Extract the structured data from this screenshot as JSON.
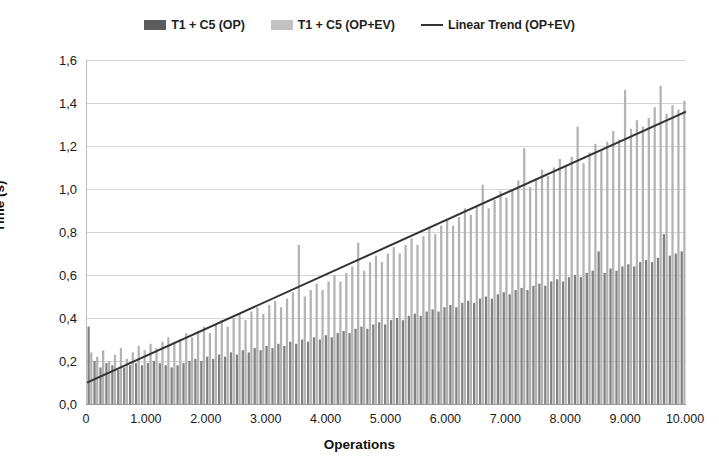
{
  "chart": {
    "type": "bar",
    "background": "#ffffff",
    "legend": {
      "position": "top-center",
      "entries": [
        {
          "label": "T1 + C5 (OP)",
          "swatch": "dark-gray-bar",
          "color": "#5c5c5c"
        },
        {
          "label": "T1 + C5 (OP+EV)",
          "swatch": "light-gray-bar",
          "color": "#c2c2c2"
        },
        {
          "label": "Linear Trend (OP+EV)",
          "swatch": "trend-line",
          "color": "#333333"
        }
      ]
    },
    "axes": {
      "y": {
        "label": "Time (s)",
        "ticks": [
          "0,0",
          "0,2",
          "0,4",
          "0,6",
          "0,8",
          "1,0",
          "1,2",
          "1,4",
          "1,6"
        ],
        "min": 0.0,
        "max": 1.6,
        "step": 0.2,
        "grid": true
      },
      "x": {
        "label": "Operations",
        "ticks": [
          "0",
          "1.000",
          "2.000",
          "3.000",
          "4.000",
          "5.000",
          "6.000",
          "7.000",
          "8.000",
          "9.000",
          "10.000"
        ],
        "min": 0,
        "max": 10000,
        "step": 1000,
        "grid": false
      }
    }
  },
  "chart_data": {
    "type": "bar",
    "title": "",
    "subtitle": "",
    "xlabel": "Operations",
    "ylabel": "Time (s)",
    "xlim": [
      0,
      10000
    ],
    "ylim": [
      0,
      1.6
    ],
    "grid": true,
    "legend_position": "top-center",
    "x": [
      0,
      100,
      200,
      300,
      400,
      500,
      600,
      700,
      800,
      900,
      1000,
      1100,
      1200,
      1300,
      1400,
      1500,
      1600,
      1700,
      1800,
      1900,
      2000,
      2100,
      2200,
      2300,
      2400,
      2500,
      2600,
      2700,
      2800,
      2900,
      3000,
      3100,
      3200,
      3300,
      3400,
      3500,
      3600,
      3700,
      3800,
      3900,
      4000,
      4100,
      4200,
      4300,
      4400,
      4500,
      4600,
      4700,
      4800,
      4900,
      5000,
      5100,
      5200,
      5300,
      5400,
      5500,
      5600,
      5700,
      5800,
      5900,
      6000,
      6100,
      6200,
      6300,
      6400,
      6500,
      6600,
      6700,
      6800,
      6900,
      7000,
      7100,
      7200,
      7300,
      7400,
      7500,
      7600,
      7700,
      7800,
      7900,
      8000,
      8100,
      8200,
      8300,
      8400,
      8500,
      8600,
      8700,
      8800,
      8900,
      9000,
      9100,
      9200,
      9300,
      9400,
      9500,
      9600,
      9700,
      9800,
      9900,
      10000
    ],
    "series": [
      {
        "name": "T1 + C5 (OP)",
        "type": "bar",
        "color": "#808080",
        "values": [
          0.36,
          0.2,
          0.17,
          0.19,
          0.18,
          0.16,
          0.17,
          0.18,
          0.19,
          0.18,
          0.19,
          0.2,
          0.19,
          0.18,
          0.17,
          0.18,
          0.19,
          0.2,
          0.21,
          0.2,
          0.22,
          0.21,
          0.23,
          0.22,
          0.24,
          0.23,
          0.25,
          0.24,
          0.26,
          0.25,
          0.27,
          0.26,
          0.28,
          0.27,
          0.29,
          0.28,
          0.3,
          0.29,
          0.31,
          0.3,
          0.32,
          0.31,
          0.33,
          0.34,
          0.33,
          0.35,
          0.36,
          0.35,
          0.37,
          0.38,
          0.37,
          0.39,
          0.4,
          0.39,
          0.41,
          0.42,
          0.41,
          0.43,
          0.44,
          0.43,
          0.45,
          0.46,
          0.45,
          0.47,
          0.48,
          0.47,
          0.49,
          0.5,
          0.49,
          0.51,
          0.52,
          0.51,
          0.53,
          0.54,
          0.53,
          0.55,
          0.56,
          0.55,
          0.57,
          0.58,
          0.57,
          0.59,
          0.6,
          0.59,
          0.61,
          0.62,
          0.71,
          0.61,
          0.63,
          0.62,
          0.64,
          0.65,
          0.64,
          0.66,
          0.67,
          0.66,
          0.68,
          0.79,
          0.69,
          0.7,
          0.71
        ],
        "max_value": 0.79,
        "first_value": 0.36
      },
      {
        "name": "T1 + C5 (OP+EV)",
        "type": "bar",
        "color": "#b3b3b3",
        "values": [
          0.24,
          0.22,
          0.25,
          0.2,
          0.23,
          0.26,
          0.21,
          0.24,
          0.27,
          0.25,
          0.28,
          0.26,
          0.29,
          0.31,
          0.28,
          0.3,
          0.33,
          0.31,
          0.34,
          0.36,
          0.33,
          0.37,
          0.39,
          0.36,
          0.4,
          0.42,
          0.39,
          0.43,
          0.45,
          0.42,
          0.46,
          0.48,
          0.45,
          0.49,
          0.52,
          0.74,
          0.5,
          0.53,
          0.56,
          0.53,
          0.57,
          0.6,
          0.57,
          0.61,
          0.64,
          0.75,
          0.62,
          0.66,
          0.69,
          0.66,
          0.7,
          0.73,
          0.7,
          0.74,
          0.77,
          0.74,
          0.78,
          0.82,
          0.79,
          0.83,
          0.86,
          0.83,
          0.87,
          0.91,
          0.88,
          0.92,
          1.02,
          0.91,
          0.95,
          0.99,
          0.96,
          1.0,
          1.04,
          1.19,
          1.01,
          1.05,
          1.09,
          1.06,
          1.1,
          1.14,
          1.11,
          1.15,
          1.29,
          1.12,
          1.17,
          1.21,
          1.18,
          1.22,
          1.27,
          1.23,
          1.46,
          1.28,
          1.32,
          1.29,
          1.33,
          1.38,
          1.48,
          1.35,
          1.39,
          1.37,
          1.41
        ],
        "max_value": 1.48
      },
      {
        "name": "Linear Trend (OP+EV)",
        "type": "line",
        "color": "#333333",
        "intercept": 0.1,
        "slope_per_10000": 1.26,
        "start_point": [
          0,
          0.1
        ],
        "end_point": [
          10000,
          1.36
        ]
      }
    ]
  }
}
